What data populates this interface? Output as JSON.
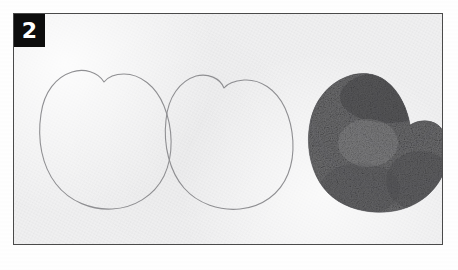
{
  "figure": {
    "panel_label": "2",
    "badge_color": "#0d0d0d",
    "badge_text_color": "#ffffff",
    "frame_border_color": "#4a4a4a",
    "paper_color": "#ececed",
    "outer_background_color": "#ffffff",
    "pencil_line_color": "#8f8f92",
    "fill_color": "#6e6e70",
    "fill_dark_color": "#3f3f42"
  },
  "specimens": [
    {
      "name": "apple-outline-left",
      "style": "pencil-outline",
      "position": "left",
      "description": "Faint pencil outline of a rounded apple/heart shape with a V notch at top"
    },
    {
      "name": "apple-outline-middle",
      "style": "pencil-outline",
      "position": "middle",
      "description": "Faint pencil outline of a rounded apple/heart shape with a narrow V notch at top"
    },
    {
      "name": "apple-filled-right",
      "style": "grainy-filled",
      "position": "right",
      "description": "Dark grainy stipple-filled apple/heart shape with a notch on the upper right"
    }
  ]
}
